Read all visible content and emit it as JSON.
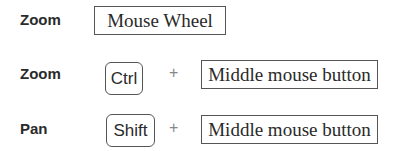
{
  "rows": [
    {
      "action": "Zoom",
      "input": "Mouse Wheel"
    },
    {
      "action": "Zoom",
      "modifier": "Ctrl",
      "plus": "+",
      "input": "Middle mouse button"
    },
    {
      "action": "Pan",
      "modifier": "Shift",
      "plus": "+",
      "input": "Middle mouse button"
    }
  ]
}
